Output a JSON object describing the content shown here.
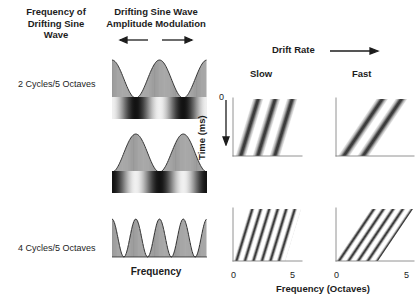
{
  "figure": {
    "headers": {
      "frequency_of_drifting_sine_wave": "Frequency of\nDrifting Sine\nWave",
      "amplitude_modulation": "Drifting Sine Wave\nAmplitude Modulation",
      "drift_rate": "Drift Rate",
      "slow": "Slow",
      "fast": "Fast"
    },
    "row_labels": {
      "row1": "2 Cycles/5 Octaves",
      "row2": "4 Cycles/5 Octaves"
    },
    "axes": {
      "middle_xlabel": "Frequency",
      "time_label": "Time (ms)",
      "time_origin": "0",
      "freq_xlabel": "Frequency (Octaves)",
      "ticks_left": [
        "0",
        "5"
      ],
      "ticks_right": [
        "0",
        "5"
      ]
    },
    "icons": {
      "am_left_arrow": "arrow-left-icon",
      "am_right_arrow": "arrow-right-icon",
      "drift_arrow": "arrow-right-icon",
      "time_arrow": "arrow-down-icon"
    },
    "colors": {
      "ink": "#1c1c1c",
      "axis": "#6e6e6e",
      "stripe_dark": "#2b2b2b",
      "stripe_mid": "#9a9a9a",
      "background": "#ffffff"
    }
  },
  "chart_data": [
    {
      "type": "line",
      "name": "amplitude-modulation-2cyc-phase0",
      "title": "Drifting Sine Wave Amplitude Modulation",
      "xlabel": "Frequency",
      "ylabel": "Amplitude",
      "cycles_per_5_octaves": 2,
      "phase_deg": 0,
      "xlim": [
        0,
        5
      ],
      "ylim": [
        0,
        1
      ],
      "grid": false
    },
    {
      "type": "line",
      "name": "amplitude-modulation-2cyc-phase180",
      "title": "Drifting Sine Wave Amplitude Modulation",
      "xlabel": "Frequency",
      "ylabel": "Amplitude",
      "cycles_per_5_octaves": 2,
      "phase_deg": 180,
      "xlim": [
        0,
        5
      ],
      "ylim": [
        0,
        1
      ],
      "grid": false
    },
    {
      "type": "line",
      "name": "amplitude-modulation-4cyc",
      "title": "Drifting Sine Wave Amplitude Modulation",
      "xlabel": "Frequency",
      "ylabel": "Amplitude",
      "cycles_per_5_octaves": 4,
      "phase_deg": 0,
      "xlim": [
        0,
        5
      ],
      "ylim": [
        0,
        1
      ],
      "grid": false
    },
    {
      "type": "heatmap",
      "name": "spectrogram-slow-2cyc",
      "row": "2 Cycles/5 Octaves",
      "column": "Slow",
      "xlabel": "Frequency (Octaves)",
      "ylabel": "Time (ms)",
      "xlim": [
        0,
        5
      ],
      "xticks": [
        0,
        5
      ],
      "ytick_top": 0,
      "cycles_per_5_octaves": 2,
      "drift_rate": "slow",
      "stripe_count": 4,
      "stripe_slant_deg": 17,
      "grid": false
    },
    {
      "type": "heatmap",
      "name": "spectrogram-fast-2cyc",
      "row": "2 Cycles/5 Octaves",
      "column": "Fast",
      "xlabel": "Frequency (Octaves)",
      "ylabel": "Time (ms)",
      "xlim": [
        0,
        5
      ],
      "xticks": [
        0,
        5
      ],
      "ytick_top": 0,
      "cycles_per_5_octaves": 2,
      "drift_rate": "fast",
      "stripe_count": 4,
      "stripe_slant_deg": 34,
      "grid": false
    },
    {
      "type": "heatmap",
      "name": "spectrogram-slow-4cyc",
      "row": "4 Cycles/5 Octaves",
      "column": "Slow",
      "xlabel": "Frequency (Octaves)",
      "ylabel": "Time (ms)",
      "xlim": [
        0,
        5
      ],
      "xticks": [
        0,
        5
      ],
      "ytick_top": 0,
      "cycles_per_5_octaves": 4,
      "drift_rate": "slow",
      "stripe_count": 8,
      "stripe_slant_deg": 17,
      "grid": false
    },
    {
      "type": "heatmap",
      "name": "spectrogram-fast-4cyc",
      "row": "4 Cycles/5 Octaves",
      "column": "Fast",
      "xlabel": "Frequency (Octaves)",
      "ylabel": "Time (ms)",
      "xlim": [
        0,
        5
      ],
      "xticks": [
        0,
        5
      ],
      "ytick_top": 0,
      "cycles_per_5_octaves": 4,
      "drift_rate": "fast",
      "stripe_count": 8,
      "stripe_slant_deg": 34,
      "grid": false
    }
  ]
}
